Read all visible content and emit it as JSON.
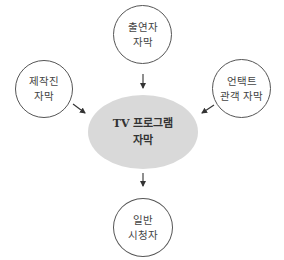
{
  "diagram": {
    "center": {
      "line1": "TV 프로그램",
      "line2": "자막",
      "fill": "#d9d9d9"
    },
    "sources": [
      {
        "id": "performers",
        "line1": "출연자",
        "line2": "자막"
      },
      {
        "id": "production-staff",
        "line1": "제작진",
        "line2": "자막"
      },
      {
        "id": "untact-audience",
        "line1": "언택트",
        "line2": "관객 자막"
      }
    ],
    "target": {
      "id": "general-viewers",
      "line1": "일반",
      "line2": "시청자"
    },
    "edges": [
      {
        "from": "출연자 자막",
        "to": "TV 프로그램 자막"
      },
      {
        "from": "제작진 자막",
        "to": "TV 프로그램 자막"
      },
      {
        "from": "언택트 관객 자막",
        "to": "TV 프로그램 자막"
      },
      {
        "from": "TV 프로그램 자막",
        "to": "일반 시청자"
      }
    ],
    "line_color": "#333333"
  }
}
